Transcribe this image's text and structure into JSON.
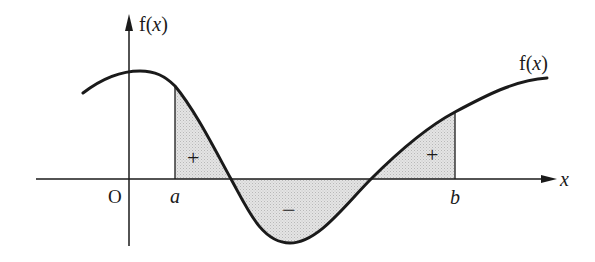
{
  "diagram": {
    "colors": {
      "background": "#ffffff",
      "stroke": "#1a1a1a",
      "shading": "#d9d9d9"
    },
    "axes": {
      "y_label_prefix": "f(",
      "y_label_var": "x",
      "y_label_suffix": ")",
      "x_label": "x",
      "origin_label": "O"
    },
    "curve_label": {
      "prefix": "f(",
      "var": "x",
      "suffix": ")"
    },
    "bounds": {
      "lower": "a",
      "upper": "b"
    },
    "regions": [
      {
        "name": "left-positive-area",
        "sign": "+"
      },
      {
        "name": "negative-area",
        "sign": "−"
      },
      {
        "name": "right-positive-area",
        "sign": "+"
      }
    ]
  }
}
